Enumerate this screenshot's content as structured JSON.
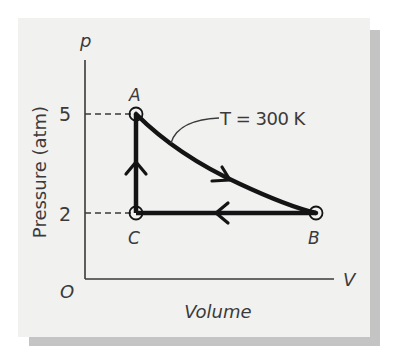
{
  "figure": {
    "type": "pV diagram",
    "panel_color": "#f1f1f0",
    "shadow_color": "#c4c4c4",
    "line_color": "#141414",
    "text_color": "#3a3a3a"
  },
  "axes": {
    "y_symbol": "p",
    "x_symbol": "V",
    "origin_label": "O",
    "y_label": "Pressure (atm)",
    "x_label": "Volume",
    "y_ticks": [
      {
        "label": "5",
        "value": 5
      },
      {
        "label": "2",
        "value": 2
      }
    ]
  },
  "points": [
    {
      "label": "A",
      "pressure_atm": 5,
      "volume": "V_C"
    },
    {
      "label": "B",
      "pressure_atm": 2,
      "volume": "V_B"
    },
    {
      "label": "C",
      "pressure_atm": 2,
      "volume": "V_C"
    }
  ],
  "processes": [
    {
      "from": "A",
      "to": "B",
      "kind": "isotherm (curve)",
      "annotation": "T = 300 K"
    },
    {
      "from": "B",
      "to": "C",
      "kind": "isobaric (horizontal)"
    },
    {
      "from": "C",
      "to": "A",
      "kind": "isochoric (vertical)"
    }
  ],
  "annotation": {
    "isotherm_label": "T = 300 K"
  }
}
